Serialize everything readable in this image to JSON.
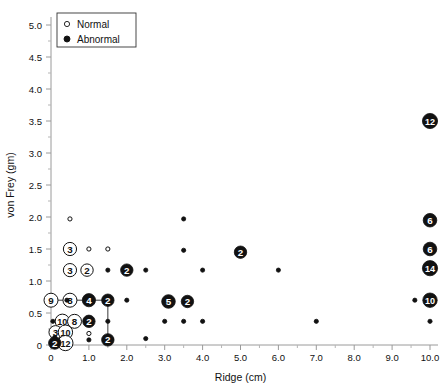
{
  "chart_data": {
    "type": "scatter",
    "title": "",
    "xlabel": "Ridge (cm)",
    "ylabel": "von Frey (gm)",
    "xlim": [
      0,
      10
    ],
    "ylim": [
      0,
      5.0
    ],
    "xticks": [
      "0",
      "1.0",
      "2.0",
      "3.0",
      "4.0",
      "5.0",
      "6.0",
      "7.0",
      "8.0",
      "9.0",
      "10.0"
    ],
    "xtick_values": [
      0,
      1,
      2,
      3,
      4,
      5,
      6,
      7,
      8,
      9,
      10
    ],
    "yticks": [
      "0",
      "0.5",
      "1.0",
      "1.5",
      "2.0",
      "2.5",
      "3.0",
      "3.5",
      "4.0",
      "4.5",
      "5.0"
    ],
    "ytick_values": [
      0,
      0.5,
      1.0,
      1.5,
      2.0,
      2.5,
      3.0,
      3.5,
      4.0,
      4.5,
      5.0
    ],
    "grid": false,
    "legend_position": "top-left",
    "series": [
      {
        "name": "Normal",
        "marker": "open-circle",
        "color": "#ffffff",
        "edge_color": "#111111",
        "points": [
          {
            "x": 0.0,
            "y": 0.7,
            "count": 9
          },
          {
            "x": 0.5,
            "y": 0.7,
            "count": 8
          },
          {
            "x": 0.3,
            "y": 0.37,
            "count": 10
          },
          {
            "x": 0.62,
            "y": 0.37,
            "count": 8
          },
          {
            "x": 0.12,
            "y": 0.2,
            "count": 3
          },
          {
            "x": 0.38,
            "y": 0.2,
            "count": 10
          },
          {
            "x": 0.38,
            "y": 0.03,
            "count": 12
          },
          {
            "x": 0.5,
            "y": 1.5,
            "count": 3
          },
          {
            "x": 0.5,
            "y": 1.17,
            "count": 3
          },
          {
            "x": 0.95,
            "y": 1.17,
            "count": 2
          },
          {
            "x": 1.0,
            "y": 1.5,
            "count": 1
          },
          {
            "x": 1.5,
            "y": 1.5,
            "count": 1
          },
          {
            "x": 0.5,
            "y": 1.97,
            "count": 1
          },
          {
            "x": 1.0,
            "y": 0.18,
            "count": 1
          }
        ]
      },
      {
        "name": "Abnormal",
        "marker": "filled-circle",
        "color": "#111111",
        "edge_color": "#111111",
        "points": [
          {
            "x": 10.0,
            "y": 3.5,
            "count": 12
          },
          {
            "x": 10.0,
            "y": 1.95,
            "count": 6
          },
          {
            "x": 10.0,
            "y": 1.5,
            "count": 6
          },
          {
            "x": 10.0,
            "y": 1.2,
            "count": 14
          },
          {
            "x": 10.0,
            "y": 0.7,
            "count": 10
          },
          {
            "x": 9.6,
            "y": 0.7,
            "count": 1
          },
          {
            "x": 10.0,
            "y": 0.37,
            "count": 1
          },
          {
            "x": 5.0,
            "y": 1.45,
            "count": 2
          },
          {
            "x": 3.5,
            "y": 1.97,
            "count": 1
          },
          {
            "x": 3.5,
            "y": 1.48,
            "count": 1
          },
          {
            "x": 1.5,
            "y": 1.17,
            "count": 1
          },
          {
            "x": 2.0,
            "y": 1.17,
            "count": 2
          },
          {
            "x": 2.5,
            "y": 1.17,
            "count": 1
          },
          {
            "x": 4.0,
            "y": 1.17,
            "count": 1
          },
          {
            "x": 6.0,
            "y": 1.17,
            "count": 1
          },
          {
            "x": 0.42,
            "y": 0.7,
            "count": 1
          },
          {
            "x": 1.0,
            "y": 0.7,
            "count": 4
          },
          {
            "x": 1.5,
            "y": 0.7,
            "count": 2
          },
          {
            "x": 2.0,
            "y": 0.7,
            "count": 1
          },
          {
            "x": 3.1,
            "y": 0.68,
            "count": 5
          },
          {
            "x": 3.6,
            "y": 0.68,
            "count": 2
          },
          {
            "x": 0.05,
            "y": 0.37,
            "count": 1
          },
          {
            "x": 1.0,
            "y": 0.37,
            "count": 2
          },
          {
            "x": 1.5,
            "y": 0.37,
            "count": 1
          },
          {
            "x": 3.0,
            "y": 0.37,
            "count": 1
          },
          {
            "x": 3.5,
            "y": 0.37,
            "count": 1
          },
          {
            "x": 4.0,
            "y": 0.37,
            "count": 1
          },
          {
            "x": 7.0,
            "y": 0.37,
            "count": 1
          },
          {
            "x": 0.1,
            "y": 0.12,
            "count": 1
          },
          {
            "x": 1.0,
            "y": 0.08,
            "count": 1
          },
          {
            "x": 1.5,
            "y": 0.08,
            "count": 2
          },
          {
            "x": 2.5,
            "y": 0.1,
            "count": 1
          },
          {
            "x": 0.1,
            "y": 0.03,
            "count": 2
          }
        ]
      }
    ],
    "connector_lines": [
      {
        "x1": 0.0,
        "y1": 0.7,
        "x2": 1.5,
        "y2": 0.7
      },
      {
        "x1": 1.5,
        "y1": 0.7,
        "x2": 1.5,
        "y2": 0.08
      }
    ]
  },
  "legend": {
    "entries": [
      {
        "label": "Normal",
        "marker": "open-circle"
      },
      {
        "label": "Abnormal",
        "marker": "filled-circle"
      }
    ]
  },
  "axes": {
    "x_title": "Ridge (cm)",
    "y_title": "von Frey (gm)"
  }
}
